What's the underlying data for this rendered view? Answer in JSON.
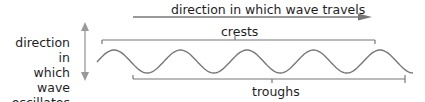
{
  "diagram": {
    "travel_label": "direction in which wave travels",
    "crests_label": "crests",
    "troughs_label": "troughs",
    "oscillation_label_lines": [
      "direction in",
      "which wave",
      "oscillates"
    ],
    "wave_cycles": 5,
    "colors": {
      "line": "#777777",
      "text": "#1e1e1e"
    }
  }
}
